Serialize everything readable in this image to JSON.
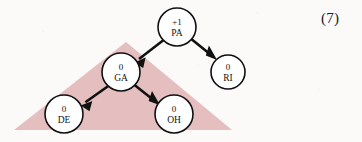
{
  "figure": {
    "label": "(7)",
    "background_color": "#fbfaf8",
    "region_color": "#e5bfbf",
    "node_fill": "#ffffff",
    "node_stroke": "#111111",
    "edge_color": "#111111"
  },
  "diagram": {
    "type": "tree",
    "nodes": [
      {
        "id": "PA",
        "name": "PA",
        "value": "+1",
        "cx": 177,
        "cy": 27,
        "r": 19
      },
      {
        "id": "RI",
        "name": "RI",
        "value": "0",
        "cx": 228,
        "cy": 72,
        "r": 17
      },
      {
        "id": "GA",
        "name": "GA",
        "value": "0",
        "cx": 121,
        "cy": 72,
        "r": 19
      },
      {
        "id": "DE",
        "name": "DE",
        "value": "0",
        "cx": 64,
        "cy": 114,
        "r": 19
      },
      {
        "id": "OH",
        "name": "OH",
        "value": "0",
        "cx": 174,
        "cy": 114,
        "r": 19
      }
    ],
    "edges": [
      {
        "from": "PA",
        "to": "GA"
      },
      {
        "from": "PA",
        "to": "RI"
      },
      {
        "from": "GA",
        "to": "DE"
      },
      {
        "from": "GA",
        "to": "OH"
      }
    ],
    "region": {
      "name": "highlighted-subtree-region",
      "shape": "triangle",
      "points": "14,130 126,42 232,130"
    }
  }
}
